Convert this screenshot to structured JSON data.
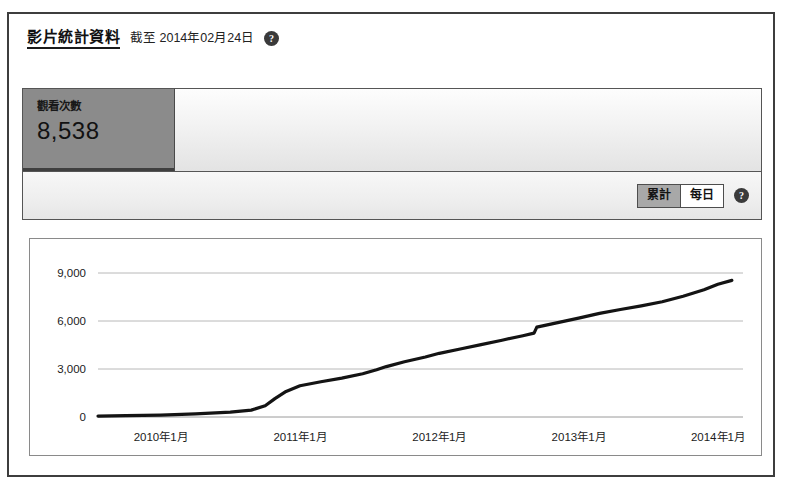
{
  "header": {
    "title": "影片統計資料",
    "as_of": "截至 2014年02月24日",
    "help_icon": "question-mark-icon",
    "help_glyph": "?"
  },
  "summary": {
    "view_count_label": "觀看次數",
    "view_count_value": "8,538"
  },
  "toolbar": {
    "cumulative_label": "累計",
    "daily_label": "每日",
    "selected": "累計",
    "help_glyph": "?"
  },
  "colors": {
    "card_background": "#8b8b8b",
    "toggle_active": "#a8a8a8",
    "line": "#141414",
    "gridline": "#b8b8b8",
    "frame": "#3d3d3d"
  },
  "chart_data": {
    "type": "line",
    "title": "",
    "xlabel": "",
    "ylabel": "",
    "ylim": [
      0,
      9000
    ],
    "yticks": [
      0,
      3000,
      6000,
      9000
    ],
    "ytick_labels": [
      "0",
      "3,000",
      "6,000",
      "9,000"
    ],
    "xtick_labels": [
      "2010年1月",
      "2011年1月",
      "2012年1月",
      "2013年1月",
      "2014年1月"
    ],
    "xtick_values": [
      2010.0,
      2011.0,
      2012.0,
      2013.0,
      2014.0
    ],
    "xlim": [
      2009.55,
      2014.18
    ],
    "grid": true,
    "legend": null,
    "series": [
      {
        "name": "累計觀看次數",
        "x": [
          2009.55,
          2009.75,
          2010.0,
          2010.25,
          2010.5,
          2010.65,
          2010.75,
          2010.82,
          2010.9,
          2011.0,
          2011.15,
          2011.3,
          2011.45,
          2011.55,
          2011.62,
          2011.75,
          2011.9,
          2012.0,
          2012.15,
          2012.3,
          2012.45,
          2012.6,
          2012.68,
          2012.7,
          2012.85,
          2013.0,
          2013.15,
          2013.3,
          2013.45,
          2013.6,
          2013.75,
          2013.9,
          2014.0,
          2014.1
        ],
        "y": [
          60,
          80,
          120,
          190,
          300,
          430,
          700,
          1150,
          1600,
          1950,
          2200,
          2430,
          2700,
          2950,
          3150,
          3450,
          3750,
          3980,
          4250,
          4520,
          4800,
          5080,
          5240,
          5620,
          5900,
          6180,
          6480,
          6720,
          6950,
          7200,
          7550,
          7950,
          8300,
          8538
        ]
      }
    ]
  }
}
